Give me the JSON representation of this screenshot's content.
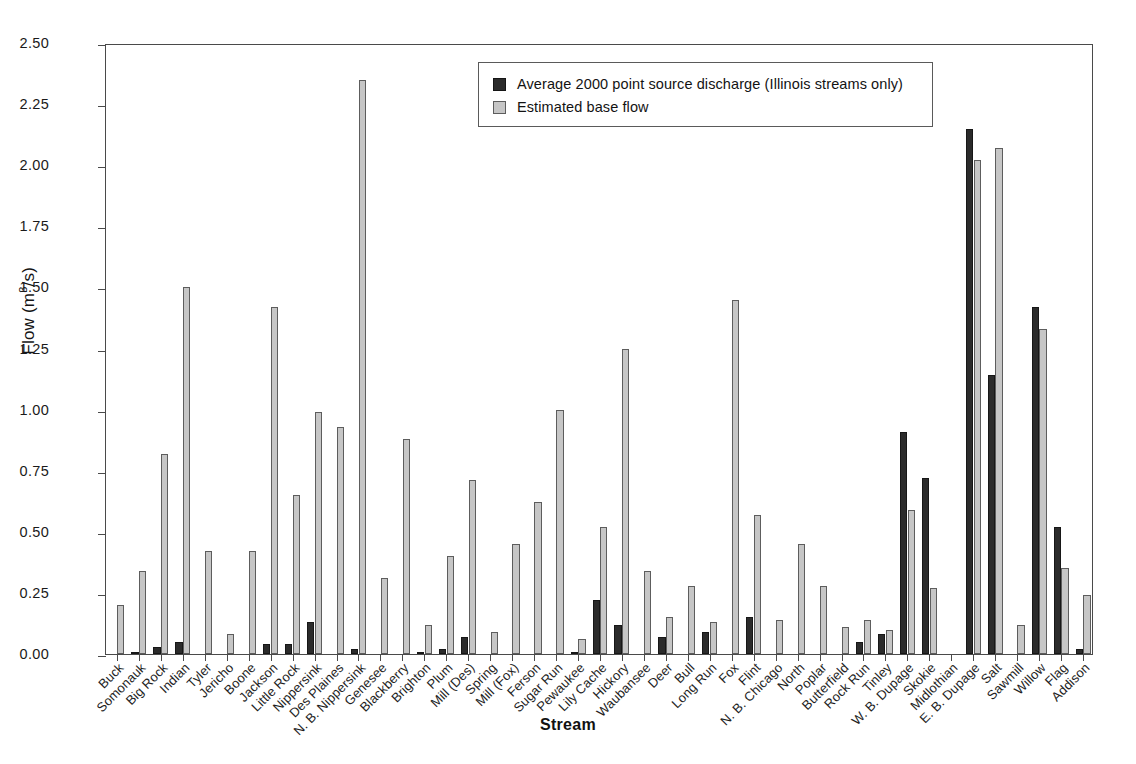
{
  "chart_data": {
    "type": "bar",
    "title": "",
    "xlabel": "Stream",
    "ylabel": "Flow (m3/s)",
    "ylabel_html": "Flow (m&#179;/s)",
    "ylim": [
      0,
      2.5
    ],
    "yticks": [
      0.0,
      0.25,
      0.5,
      0.75,
      1.0,
      1.25,
      1.5,
      1.75,
      2.0,
      2.25,
      2.5
    ],
    "ytick_labels": [
      "0.00",
      "0.25",
      "0.50",
      "0.75",
      "1.00",
      "1.25",
      "1.50",
      "1.75",
      "2.00",
      "2.25",
      "2.50"
    ],
    "grid": false,
    "legend_position": "top-center",
    "categories": [
      "Buck",
      "Somonauk",
      "Big Rock",
      "Indian",
      "Tyler",
      "Jericho",
      "Boone",
      "Jackson",
      "Little Rock",
      "Nippersink",
      "Des Plaines",
      "N. B. Nippersink",
      "Genesee",
      "Blackberry",
      "Brighton",
      "Plum",
      "Mill (Des)",
      "Spring",
      "Mill (Fox)",
      "Ferson",
      "Sugar Run",
      "Pewaukee",
      "Lily Cache",
      "Hickory",
      "Waubansee",
      "Deer",
      "Bull",
      "Long Run",
      "Fox",
      "Flint",
      "N. B. Chicago",
      "North",
      "Poplar",
      "Butterfield",
      "Rock Run",
      "Tinley",
      "W. B. Dupage",
      "Skokie",
      "Midlothian",
      "E. B. Dupage",
      "Salt",
      "Sawmill",
      "Willow",
      "Flag",
      "Addison"
    ],
    "series": [
      {
        "name": "Average 2000 point source discharge (Illinois streams only)",
        "color": "#2b2b2b",
        "values": [
          0.0,
          0.01,
          0.03,
          0.05,
          0.0,
          0.0,
          0.0,
          0.04,
          0.04,
          0.13,
          0.0,
          0.02,
          0.0,
          0.0,
          0.01,
          0.02,
          0.07,
          0.0,
          0.0,
          0.0,
          0.0,
          0.01,
          0.22,
          0.12,
          0.0,
          0.07,
          0.0,
          0.09,
          0.0,
          0.15,
          0.0,
          0.0,
          0.0,
          0.0,
          0.05,
          0.08,
          0.91,
          0.72,
          0.0,
          2.15,
          1.14,
          0.0,
          1.42,
          0.52,
          0.02
        ]
      },
      {
        "name": "Estimated base flow",
        "color": "#c6c6c6",
        "values": [
          0.2,
          0.34,
          0.82,
          1.5,
          0.42,
          0.08,
          0.42,
          1.42,
          0.65,
          0.99,
          0.93,
          2.35,
          0.31,
          0.88,
          0.12,
          0.4,
          0.71,
          0.09,
          0.45,
          0.62,
          1.0,
          0.06,
          0.52,
          1.25,
          0.34,
          0.15,
          0.28,
          0.13,
          1.45,
          0.57,
          0.14,
          0.45,
          0.28,
          0.11,
          0.14,
          0.1,
          0.59,
          0.27,
          0.0,
          2.02,
          2.07,
          0.12,
          1.33,
          0.35,
          0.24
        ]
      }
    ]
  },
  "legend": {
    "items": [
      {
        "swatch": "dark",
        "label": "Average 2000 point source discharge (Illinois streams only)"
      },
      {
        "swatch": "light",
        "label": "Estimated base flow"
      }
    ]
  },
  "axes": {
    "x_title": "Stream",
    "y_title": "Flow (m3/s)"
  }
}
